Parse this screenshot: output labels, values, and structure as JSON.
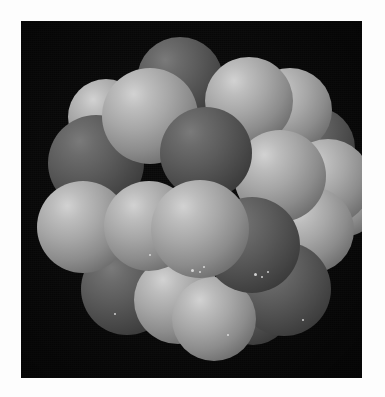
{
  "page": {
    "background_color": "#fdfdfd",
    "width": 385,
    "height": 397,
    "caption": ""
  },
  "figure": {
    "name": "space-filling-molecular-model",
    "kind": "photograph",
    "color_mode": "grayscale",
    "background_color": "#080808",
    "frame": {
      "x": 21,
      "y": 21,
      "width": 341,
      "height": 357
    },
    "light_source": "upper-left",
    "palette": {
      "background": "#080808",
      "atom_light": "#a6a6a6",
      "atom_light_highlight": "#d2d2d2",
      "atom_dark": "#5b5b5b",
      "atom_dark_highlight": "#7a7a7a",
      "page_white": "#fdfdfd"
    },
    "atoms": [
      {
        "id": "a01",
        "shade": "dark",
        "x": 116,
        "y": 16,
        "d": 86,
        "z": 4
      },
      {
        "id": "a02",
        "shade": "light",
        "x": 81,
        "y": 47,
        "d": 96,
        "z": 7
      },
      {
        "id": "a03",
        "shade": "light",
        "x": 47,
        "y": 58,
        "d": 76,
        "z": 3
      },
      {
        "id": "a04",
        "shade": "light",
        "x": 184,
        "y": 36,
        "d": 88,
        "z": 6
      },
      {
        "id": "a05",
        "shade": "light",
        "x": 227,
        "y": 47,
        "d": 84,
        "z": 4
      },
      {
        "id": "a06",
        "shade": "dark",
        "x": 252,
        "y": 86,
        "d": 82,
        "z": 3
      },
      {
        "id": "a07",
        "shade": "dark",
        "x": 27,
        "y": 94,
        "d": 96,
        "z": 5
      },
      {
        "id": "a08",
        "shade": "dark",
        "x": 139,
        "y": 86,
        "d": 92,
        "z": 9
      },
      {
        "id": "a09",
        "shade": "light",
        "x": 213,
        "y": 109,
        "d": 92,
        "z": 8
      },
      {
        "id": "a10",
        "shade": "light",
        "x": 264,
        "y": 118,
        "d": 86,
        "z": 5
      },
      {
        "id": "a11",
        "shade": "light",
        "x": 16,
        "y": 160,
        "d": 92,
        "z": 6
      },
      {
        "id": "a12",
        "shade": "light",
        "x": 83,
        "y": 160,
        "d": 90,
        "z": 7
      },
      {
        "id": "a13",
        "shade": "light",
        "x": 130,
        "y": 159,
        "d": 98,
        "z": 10
      },
      {
        "id": "a14",
        "shade": "dark",
        "x": 183,
        "y": 176,
        "d": 96,
        "z": 8
      },
      {
        "id": "a15",
        "shade": "light",
        "x": 247,
        "y": 166,
        "d": 86,
        "z": 5
      },
      {
        "id": "a16",
        "shade": "dark",
        "x": 216,
        "y": 221,
        "d": 94,
        "z": 6
      },
      {
        "id": "a17",
        "shade": "dark",
        "x": 60,
        "y": 222,
        "d": 92,
        "z": 5
      },
      {
        "id": "a18",
        "shade": "light",
        "x": 113,
        "y": 235,
        "d": 88,
        "z": 6
      },
      {
        "id": "a19",
        "shade": "light",
        "x": 151,
        "y": 256,
        "d": 84,
        "z": 7
      },
      {
        "id": "a20",
        "shade": "dark",
        "x": 193,
        "y": 246,
        "d": 78,
        "z": 4
      },
      {
        "id": "a21",
        "shade": "light",
        "x": 287,
        "y": 146,
        "d": 70,
        "z": 3
      }
    ],
    "specks": [
      {
        "x": 170,
        "y": 248,
        "s": 3
      },
      {
        "x": 178,
        "y": 250,
        "s": 2
      },
      {
        "x": 182,
        "y": 245,
        "s": 2
      },
      {
        "x": 233,
        "y": 252,
        "s": 3
      },
      {
        "x": 240,
        "y": 255,
        "s": 2
      },
      {
        "x": 246,
        "y": 250,
        "s": 2
      },
      {
        "x": 128,
        "y": 233,
        "s": 2
      },
      {
        "x": 93,
        "y": 292,
        "s": 2
      },
      {
        "x": 206,
        "y": 313,
        "s": 2
      },
      {
        "x": 281,
        "y": 298,
        "s": 2
      }
    ]
  }
}
